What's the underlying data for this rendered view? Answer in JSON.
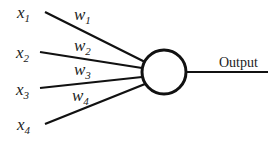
{
  "diagram": {
    "inputs": [
      {
        "name": "x",
        "sub": "1"
      },
      {
        "name": "x",
        "sub": "2"
      },
      {
        "name": "x",
        "sub": "3"
      },
      {
        "name": "x",
        "sub": "4"
      }
    ],
    "weights": [
      {
        "name": "w",
        "sub": "1"
      },
      {
        "name": "w",
        "sub": "2"
      },
      {
        "name": "w",
        "sub": "3"
      },
      {
        "name": "w",
        "sub": "4"
      }
    ],
    "output_label": "Output"
  }
}
